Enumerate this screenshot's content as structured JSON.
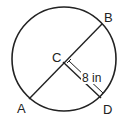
{
  "diagram": {
    "type": "circle-geometry",
    "points": {
      "A": "A",
      "B": "B",
      "C": "C",
      "D": "D"
    },
    "segments": [
      {
        "name": "diameter",
        "from": "A",
        "to": "B"
      },
      {
        "name": "radius",
        "from": "C",
        "to": "D"
      }
    ],
    "measurement": {
      "segment": "CD",
      "label": "8 in",
      "value": 8,
      "unit": "in"
    },
    "colors": {
      "stroke": "#222222",
      "background": "#ffffff"
    }
  }
}
